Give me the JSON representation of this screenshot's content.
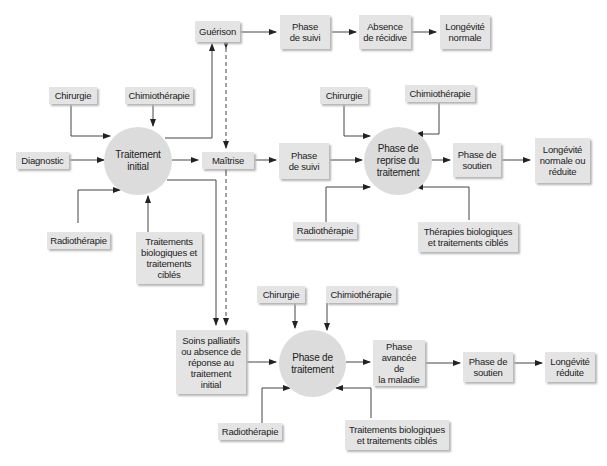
{
  "diagram": {
    "top_row": {
      "guerison": "Guérison",
      "phase_suivi": "Phase\nde suivi",
      "absence_recidive": "Absence\nde récidive",
      "longevite_normale": "Longévité\nnormale"
    },
    "initial": {
      "chirurgie": "Chirurgie",
      "chimiotherapie": "Chimiothérapie",
      "diagnostic": "Diagnostic",
      "traitement_initial": "Traitement\ninitial",
      "radiotherapie": "Radiothérapie",
      "traitements_bio": "Traitements\nbiologiques et\ntraitements\nciblés",
      "maitrise": "Maîtrise"
    },
    "middle_row": {
      "phase_suivi": "Phase\nde suivi",
      "chirurgie": "Chirurgie",
      "chimiotherapie": "Chimiothérapie",
      "phase_reprise": "Phase de\nreprise du\ntraitement",
      "phase_soutien": "Phase de\nsoutien",
      "longevite": "Longévité\nnormale ou\nréduite",
      "radiotherapie": "Radiothérapie",
      "therapies_bio": "Thérapies biologiques\net traitements ciblés"
    },
    "bottom_row": {
      "soins_palliatifs": "Soins palliatifs\nou absence de\nréponse au\ntraitement\ninitial",
      "chirurgie": "Chirurgie",
      "chimiotherapie": "Chimiothérapie",
      "phase_traitement": "Phase de\ntraitement",
      "phase_avancee": "Phase\navancée de\nla maladie",
      "phase_soutien": "Phase de\nsoutien",
      "longevite_reduite": "Longévité\nréduite",
      "radiotherapie": "Radiothérapie",
      "traitements_bio": "Traitements biologiques\net traitements ciblés"
    },
    "colors": {
      "box": "#e4e4e4",
      "circle": "#dcdcdc",
      "line": "#333333"
    }
  }
}
